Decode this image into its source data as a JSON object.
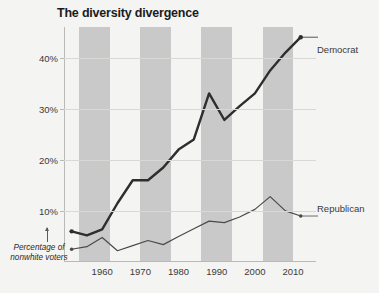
{
  "chart_data": {
    "type": "line",
    "title": "The diversity divergence",
    "subtitle": "",
    "xlabel": "",
    "ylabel": "",
    "annotation": "Percentage of nonwhite voters",
    "annotation_line1": "Percentage of",
    "annotation_line2": "nonwhite voters",
    "xlim": [
      1950,
      2016
    ],
    "ylim": [
      0,
      46
    ],
    "grid": "horizontal",
    "legend_position": "right-inline",
    "y_ticks": [
      10,
      20,
      30,
      40
    ],
    "y_tick_labels": [
      "10%",
      "20%",
      "30%",
      "40%"
    ],
    "x_ticks": [
      1960,
      1970,
      1980,
      1990,
      2000,
      2010
    ],
    "x_tick_labels": [
      "1960",
      "1970",
      "1980",
      "1990",
      "2000",
      "2010"
    ],
    "shaded_bands": [
      {
        "start": 1954,
        "end": 1962
      },
      {
        "start": 1970,
        "end": 1978
      },
      {
        "start": 1986,
        "end": 1994
      },
      {
        "start": 2002,
        "end": 2010
      }
    ],
    "x": [
      1952,
      1956,
      1960,
      1964,
      1968,
      1972,
      1976,
      1980,
      1984,
      1988,
      1992,
      1996,
      2000,
      2004,
      2008,
      2012
    ],
    "series": [
      {
        "name": "Democrat",
        "color": "#2e2e2e",
        "values": [
          6.0,
          5.2,
          6.4,
          11.5,
          16.0,
          16.0,
          18.5,
          22.0,
          24.0,
          33.0,
          27.8,
          30.5,
          33.0,
          37.5,
          41.0,
          44.0
        ]
      },
      {
        "name": "Republican",
        "color": "#4a4a4a",
        "values": [
          2.5,
          3.0,
          4.8,
          2.2,
          3.2,
          4.2,
          3.4,
          5.0,
          6.5,
          8.0,
          7.7,
          8.8,
          10.3,
          12.8,
          10.0,
          9.0
        ]
      }
    ]
  },
  "labels": {
    "democrat": "Democrat",
    "republican": "Republican"
  }
}
